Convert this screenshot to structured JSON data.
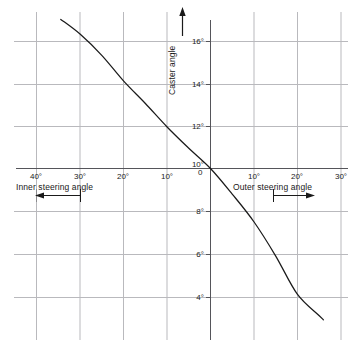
{
  "chart_data": {
    "type": "line",
    "title": "",
    "subtitle": "",
    "xlabel_left": "Inner steering angle",
    "xlabel_right": "Outer steering angle",
    "ylabel": "Caster angle",
    "origin_label": "0",
    "grid": true,
    "legend": "none",
    "xlim": [
      -35,
      35
    ],
    "ylim": [
      2.8,
      17.2
    ],
    "x_ticks_left": [
      "40°",
      "30°",
      "20°",
      "10°"
    ],
    "x_ticks_right": [
      "10°",
      "20°",
      "30°"
    ],
    "x_tick_values_left": [
      -40,
      -30,
      -20,
      -10
    ],
    "x_tick_values_right": [
      10,
      20,
      30
    ],
    "y_ticks": [
      "16°",
      "14°",
      "12°",
      "10°",
      "8°",
      "6°",
      "4°"
    ],
    "y_tick_values": [
      16,
      14,
      12,
      10,
      8,
      6,
      4
    ],
    "arrow_left_direction": "left",
    "arrow_right_direction": "right",
    "y_axis_arrow_direction": "up",
    "series": [
      {
        "name": "Caster angle vs steering angle",
        "x": [
          -34.5,
          -30,
          -25,
          -20,
          -15,
          -10,
          -5,
          0,
          5,
          10,
          15,
          20,
          25,
          26
        ],
        "y": [
          17.0,
          16.3,
          15.3,
          14.1,
          13.05,
          11.95,
          10.95,
          10.0,
          8.8,
          7.5,
          5.9,
          4.1,
          3.1,
          2.9
        ]
      }
    ],
    "colors": {
      "curve": "#1a1a1a",
      "grid": "#b9b9bd",
      "axis": "#6e6e72",
      "text": "#1a1a1a",
      "background": "#ffffff"
    }
  }
}
